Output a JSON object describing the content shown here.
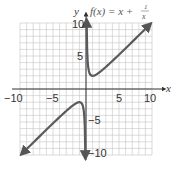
{
  "chart_data": {
    "type": "line",
    "title_parts": {
      "lhs": "f(x) = x +",
      "num": "1",
      "den": "x"
    },
    "xlabel": "x",
    "ylabel": "y",
    "xlim": [
      -10,
      10
    ],
    "ylim": [
      -10,
      10
    ],
    "grid": true,
    "grid_step": 1,
    "x_ticks": [
      {
        "value": -10,
        "label": "−10"
      },
      {
        "value": -5,
        "label": "−5"
      },
      {
        "value": 5,
        "label": "5"
      },
      {
        "value": 10,
        "label": "10"
      }
    ],
    "y_ticks": [
      {
        "value": 10,
        "label": "10"
      },
      {
        "value": 5,
        "label": "5"
      },
      {
        "value": -5,
        "label": "−5"
      },
      {
        "value": -10,
        "label": "−10"
      }
    ],
    "series": [
      {
        "name": "f(x) = x + 1/x (x > 0)",
        "x": [
          0.1,
          0.2,
          0.5,
          1,
          2,
          3,
          5,
          7,
          9.5
        ],
        "y": [
          10.1,
          5.2,
          2.5,
          2,
          2.5,
          3.33,
          5.2,
          7.14,
          9.61
        ]
      },
      {
        "name": "f(x) = x + 1/x (x < 0)",
        "x": [
          -9.5,
          -7,
          -5,
          -3,
          -2,
          -1,
          -0.5,
          -0.2,
          -0.1
        ],
        "y": [
          -9.61,
          -7.14,
          -5.2,
          -3.33,
          -2.5,
          -2,
          -2.5,
          -5.2,
          -10.1
        ]
      }
    ],
    "asymptote": "x = 0",
    "colors": {
      "curve": "#555555",
      "grid": "#bbbbbb",
      "axis": "#333333"
    }
  },
  "labels": {
    "x_axis": "x",
    "y_axis": "y",
    "title_lhs": "f(x) = x +",
    "title_num": "1",
    "title_den": "x",
    "xt_m10": "−10",
    "xt_m5": "−5",
    "xt_5": "5",
    "xt_10": "10",
    "yt_10": "10",
    "yt_5": "5",
    "yt_m5": "−5",
    "yt_m10": "−10"
  }
}
